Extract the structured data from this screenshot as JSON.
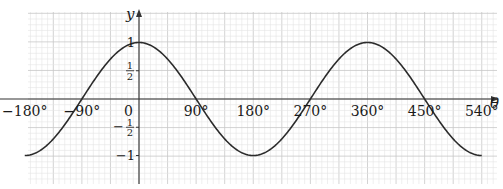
{
  "chart_data": {
    "type": "line",
    "title": "",
    "function": "y = cos(theta)",
    "xlabel": "θ",
    "ylabel": "y",
    "xlim": [
      -180,
      556
    ],
    "ylim": [
      -1.25,
      1.3
    ],
    "x_ticks": [
      {
        "value": -180,
        "label": "−180°"
      },
      {
        "value": -90,
        "label": "−90°"
      },
      {
        "value": 0,
        "label": "0"
      },
      {
        "value": 90,
        "label": "90°"
      },
      {
        "value": 180,
        "label": "180°"
      },
      {
        "value": 270,
        "label": "270°"
      },
      {
        "value": 360,
        "label": "360°"
      },
      {
        "value": 450,
        "label": "450°"
      },
      {
        "value": 540,
        "label": "540°"
      }
    ],
    "y_ticks": [
      {
        "value": 1,
        "label": "1"
      },
      {
        "value": 0.5,
        "label": "1/2"
      },
      {
        "value": -0.5,
        "label": "−1/2"
      },
      {
        "value": -1,
        "label": "−1"
      }
    ],
    "grid": true,
    "legend": null,
    "series": [
      {
        "name": "cos θ",
        "x": [
          -180,
          -135,
          -90,
          -45,
          0,
          45,
          90,
          135,
          180,
          225,
          270,
          315,
          360,
          405,
          450,
          495,
          540
        ],
        "values": [
          -1,
          -0.71,
          0,
          0.71,
          1,
          0.71,
          0,
          -0.71,
          -1,
          -0.71,
          0,
          0.71,
          1,
          0.71,
          0,
          -0.71,
          -1
        ]
      }
    ],
    "colors": {
      "curve": "#2b2b2b",
      "axes": "#333333",
      "grid_minor": "#e4e4e4",
      "grid_major": "#c8c8c8"
    }
  }
}
